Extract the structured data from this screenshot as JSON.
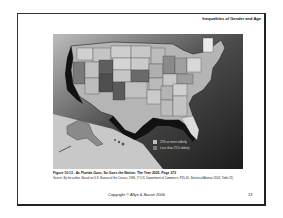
{
  "slide": {
    "header_title": "Inequalities of Gender and Age",
    "figure": {
      "caption": "Figure 10.13 - As Florida Goes, So Goes the Nation: The Year 2025, Page 272",
      "source": "Source: By the author. Based on U.S. Bureau of the Census, 1996, (? U.S. Department of Commerce, P25-45, Statistical Abstract 2002, Table 21)",
      "legend": [
        {
          "label": "25% or more elderly",
          "color": "#bdbdbd"
        },
        {
          "label": "Less than 25% elderly",
          "color": "#7a7a7a"
        }
      ]
    },
    "footer": {
      "copyright": "Copyright © Allyn & Bacon 2006",
      "page_number": "13"
    }
  }
}
